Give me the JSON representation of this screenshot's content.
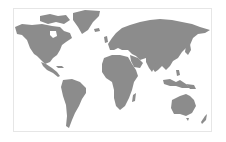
{
  "map": {
    "type": "world-map",
    "projection": "equirectangular-like",
    "land_color": "#8c8c8c",
    "ocean_color": "#ffffff",
    "frame_color": "#e6e6e6",
    "regions": [
      "north-america",
      "greenland",
      "central-america",
      "south-america",
      "europe",
      "africa",
      "asia",
      "middle-east",
      "india",
      "southeast-asia",
      "japan",
      "indonesia",
      "australia",
      "new-zealand",
      "madagascar",
      "uk",
      "iceland"
    ]
  }
}
